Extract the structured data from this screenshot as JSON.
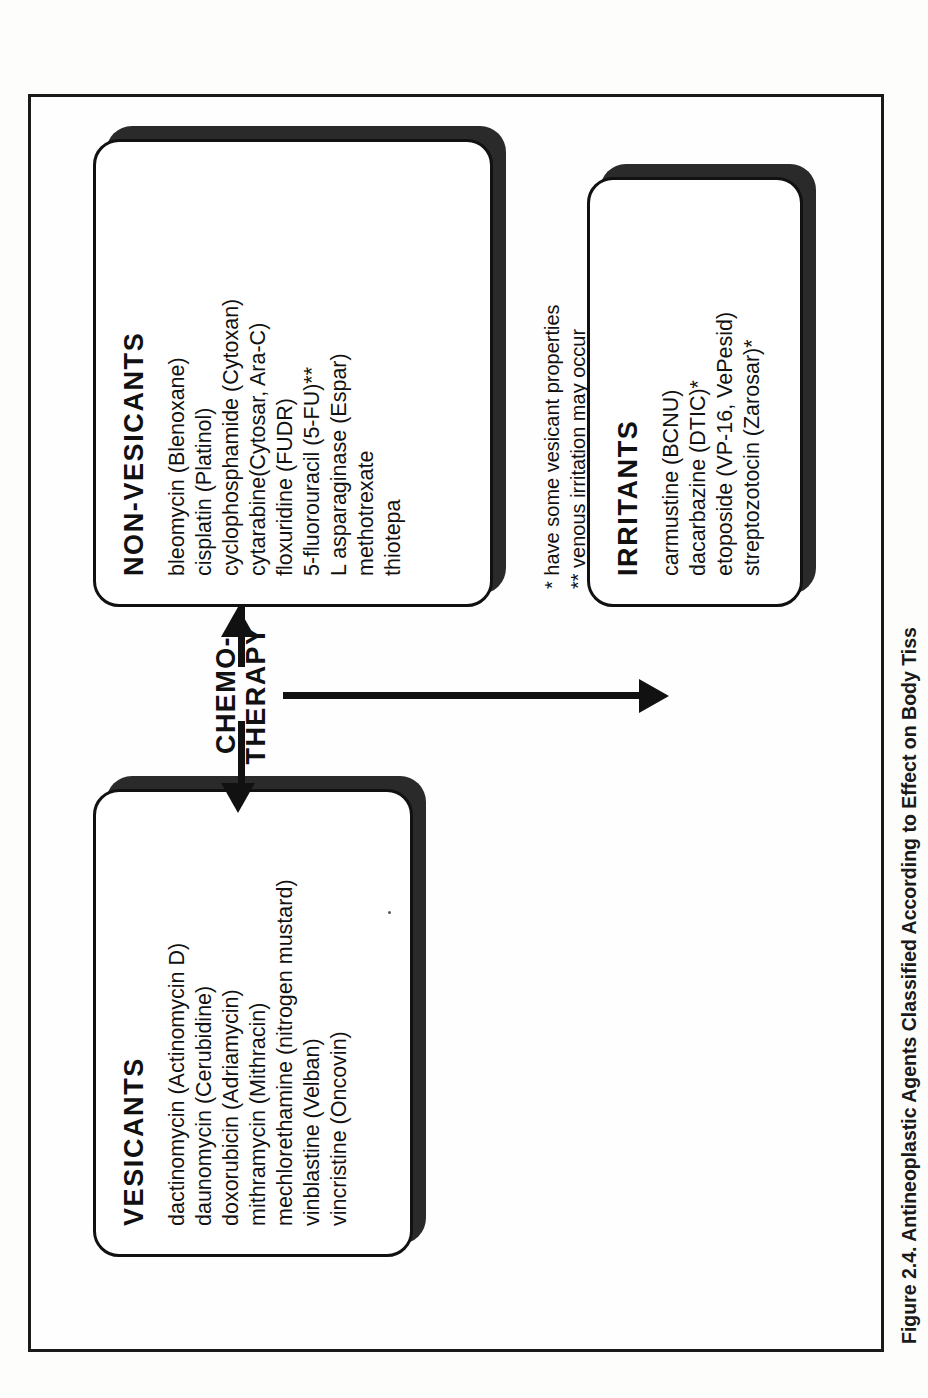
{
  "figure": {
    "caption": "Figure 2.4.  Antineoplastic Agents Classified According to Effect on Body Tiss"
  },
  "center": {
    "label_line1": "CHEMO-",
    "label_line2": "THERAPY"
  },
  "boxes": {
    "vesicants": {
      "title": "VESICANTS",
      "items": [
        "dactinomycin (Actinomycin D)",
        "daunomycin (Cerubidine)",
        "doxorubicin (Adriamycin)",
        "mithramycin (Mithracin)",
        "mechlorethamine (nitrogen mustard)",
        "vinblastine (Velban)",
        "vincristine (Oncovin)"
      ]
    },
    "nonvesicants": {
      "title": "NON-VESICANTS",
      "items": [
        "bleomycin (Blenoxane)",
        "cisplatin (Platinol)",
        "cyclophosphamide (Cytoxan)",
        "cytarabine(Cytosar, Ara-C)",
        "floxuridine (FUDR)",
        "5-fluorouracil (5-FU)**",
        "L asparaginase (Espar)",
        "methotrexate",
        "thiotepa"
      ]
    },
    "irritants": {
      "title": "IRRITANTS",
      "items": [
        "carmustine (BCNU)",
        "dacarbazine (DTIC)*",
        "etoposide (VP-16, VePesid)",
        "streptozotocin (Zarosar)*"
      ]
    }
  },
  "footnotes": [
    "*  have some vesicant properties",
    "** venous irritation may occur"
  ],
  "colors": {
    "ink": "#111111",
    "shadow": "#2a2a2a",
    "paper": "#fefefe"
  }
}
